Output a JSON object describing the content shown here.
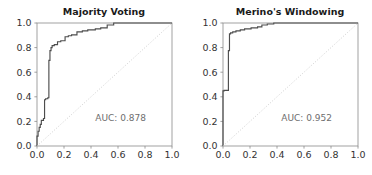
{
  "figure": {
    "background_color": "#ffffff",
    "width": 372,
    "height": 175,
    "panel_count": 2
  },
  "style": {
    "curve_color": "#4d4d4d",
    "chance_line_color": "#c8c8c8",
    "axis_color": "#8a8a8a",
    "title_color": "#1a1a1a",
    "tick_label_color": "#333333",
    "annotation_color": "#6e6e6e"
  },
  "chart_data": [
    {
      "type": "line",
      "title": "Majority Voting",
      "xlabel": "",
      "ylabel": "",
      "xlim": [
        0.0,
        1.0
      ],
      "ylim": [
        0.0,
        1.0
      ],
      "grid": false,
      "legend": "none",
      "annotations": [
        {
          "name": "auc-annotation",
          "text": "AUC: 0.878",
          "x": 0.62,
          "y": 0.2
        }
      ],
      "xticks": [
        0.0,
        0.2,
        0.4,
        0.6,
        0.8,
        1.0
      ],
      "yticks": [
        0.0,
        0.2,
        0.4,
        0.6,
        0.8,
        1.0
      ],
      "xticklabels": [
        "0.0",
        "0.2",
        "0.4",
        "0.6",
        "0.8",
        "1.0"
      ],
      "yticklabels": [
        "0.0",
        "0.2",
        "0.4",
        "0.6",
        "0.8",
        "1.0"
      ],
      "series": [
        {
          "name": "ROC curve",
          "auc": 0.878,
          "style": "step",
          "x": [
            0.0,
            0.0,
            0.008,
            0.008,
            0.016,
            0.016,
            0.024,
            0.024,
            0.032,
            0.032,
            0.048,
            0.048,
            0.056,
            0.056,
            0.064,
            0.064,
            0.08,
            0.08,
            0.088,
            0.088,
            0.096,
            0.096,
            0.104,
            0.104,
            0.112,
            0.112,
            0.128,
            0.128,
            0.152,
            0.152,
            0.176,
            0.176,
            0.208,
            0.208,
            0.232,
            0.232,
            0.256,
            0.256,
            0.296,
            0.296,
            0.336,
            0.336,
            0.376,
            0.376,
            0.432,
            0.432,
            0.472,
            0.472,
            0.52,
            0.52,
            0.568,
            0.568,
            1.0
          ],
          "y": [
            0.0,
            0.08,
            0.08,
            0.12,
            0.12,
            0.152,
            0.152,
            0.176,
            0.176,
            0.208,
            0.208,
            0.224,
            0.224,
            0.376,
            0.376,
            0.384,
            0.384,
            0.392,
            0.392,
            0.696,
            0.696,
            0.776,
            0.776,
            0.8,
            0.8,
            0.816,
            0.816,
            0.824,
            0.824,
            0.848,
            0.848,
            0.856,
            0.856,
            0.888,
            0.888,
            0.896,
            0.896,
            0.904,
            0.904,
            0.928,
            0.928,
            0.936,
            0.936,
            0.944,
            0.944,
            0.952,
            0.952,
            0.96,
            0.96,
            0.984,
            0.984,
            1.0,
            1.0
          ]
        },
        {
          "name": "chance",
          "style": "dotted-diagonal",
          "x": [
            0.0,
            1.0
          ],
          "y": [
            0.0,
            1.0
          ]
        }
      ]
    },
    {
      "type": "line",
      "title": "Merino's Windowing",
      "xlabel": "",
      "ylabel": "",
      "xlim": [
        0.0,
        1.0
      ],
      "ylim": [
        0.0,
        1.0
      ],
      "grid": false,
      "legend": "none",
      "annotations": [
        {
          "name": "auc-annotation",
          "text": "AUC: 0.952",
          "x": 0.62,
          "y": 0.2
        }
      ],
      "xticks": [
        0.0,
        0.2,
        0.4,
        0.6,
        0.8,
        1.0
      ],
      "yticks": [
        0.0,
        0.2,
        0.4,
        0.6,
        0.8,
        1.0
      ],
      "xticklabels": [
        "0.0",
        "0.2",
        "0.4",
        "0.6",
        "0.8",
        "1.0"
      ],
      "yticklabels": [
        "0.0",
        "0.2",
        "0.4",
        "0.6",
        "0.8",
        "1.0"
      ],
      "series": [
        {
          "name": "ROC curve",
          "auc": 0.952,
          "style": "step",
          "x": [
            0.0,
            0.0,
            0.008,
            0.008,
            0.04,
            0.04,
            0.048,
            0.048,
            0.056,
            0.056,
            0.072,
            0.072,
            0.096,
            0.096,
            0.128,
            0.128,
            0.16,
            0.16,
            0.208,
            0.208,
            0.256,
            0.256,
            0.288,
            0.288,
            0.328,
            0.328,
            0.376,
            0.376,
            1.0
          ],
          "y": [
            0.0,
            0.448,
            0.448,
            0.452,
            0.452,
            0.776,
            0.776,
            0.912,
            0.912,
            0.92,
            0.92,
            0.928,
            0.928,
            0.936,
            0.936,
            0.944,
            0.944,
            0.952,
            0.952,
            0.96,
            0.96,
            0.968,
            0.968,
            0.984,
            0.984,
            0.992,
            0.992,
            1.0,
            1.0
          ]
        },
        {
          "name": "chance",
          "style": "dotted-diagonal",
          "x": [
            0.0,
            1.0
          ],
          "y": [
            0.0,
            1.0
          ]
        }
      ]
    }
  ]
}
